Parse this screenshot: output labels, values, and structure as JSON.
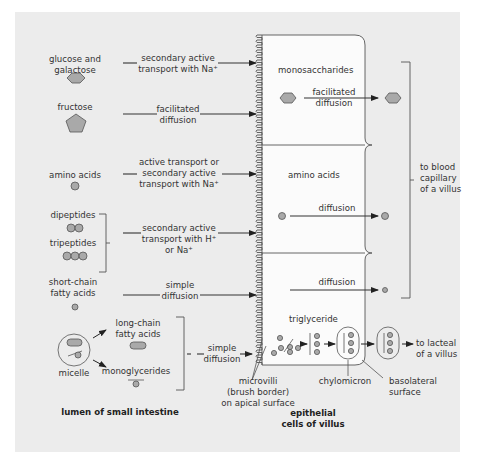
{
  "diagram": {
    "regions": {
      "lumen_label": "lumen of small intestine",
      "epithelial_label_line1": "epithelial",
      "epithelial_label_line2": "cells of villus",
      "microvilli_line1": "microvilli",
      "microvilli_line2": "(brush border)",
      "microvilli_line3": "on apical surface",
      "blood_line1": "to blood",
      "blood_line2": "capillary",
      "blood_line3": "of a villus",
      "lacteal_line1": "to lacteal",
      "lacteal_line2": "of a villus",
      "chylomicron": "chylomicron",
      "basolateral_line1": "basolateral",
      "basolateral_line2": "surface"
    },
    "nutrients": [
      {
        "line1": "glucose and",
        "line2": "galactose",
        "shape": "hexagon",
        "transport_line1": "secondary active",
        "transport_line2": "transport with Na⁺"
      },
      {
        "line1": "fructose",
        "shape": "pentagon",
        "transport_line1": "facilitated",
        "transport_line2": "diffusion"
      },
      {
        "line1": "amino acids",
        "shape": "circle",
        "transport_line1": "active transport or",
        "transport_line2": "secondary active",
        "transport_line3": "transport with Na⁺"
      },
      {
        "line1": "dipeptides",
        "line2": "tripeptides",
        "shape": "circle-chain",
        "transport_line1": "secondary active",
        "transport_line2": "transport with H⁺",
        "transport_line3": "or Na⁺"
      },
      {
        "line1": "short-chain",
        "line2": "fatty acids",
        "shape": "small-circle",
        "transport_line1": "simple",
        "transport_line2": "diffusion"
      },
      {
        "line1": "micelle",
        "shape": "micelle",
        "transport_line1": "simple",
        "transport_line2": "diffusion"
      }
    ],
    "micelle_products": {
      "lcfa_line1": "long-chain",
      "lcfa_line2": "fatty acids",
      "mono": "monoglycerides"
    },
    "cells": [
      {
        "label": "monosaccharides",
        "exit_line1": "facilitated",
        "exit_line2": "diffusion"
      },
      {
        "label": "amino acids",
        "exit": "diffusion"
      },
      {
        "label": "",
        "exit": "diffusion",
        "lower_label": "triglyceride"
      }
    ],
    "colors": {
      "panel": "#ececec",
      "shape_fill": "#a9a9a9",
      "stroke": "#444444",
      "cell_fill": "#fbfbfb"
    }
  }
}
